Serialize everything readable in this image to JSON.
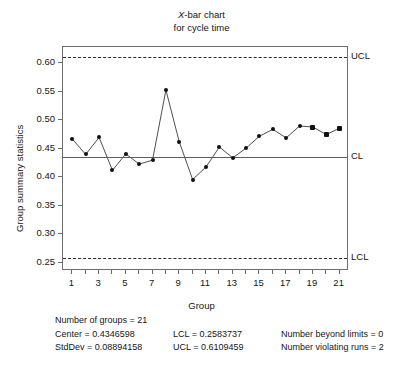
{
  "chart_data": {
    "type": "line",
    "title": "X-bar chart for cycle time",
    "title_lines": [
      "X-bar chart",
      "for cycle time"
    ],
    "title_italic_prefix": "X",
    "xlabel": "Group",
    "ylabel": "Group summary statistics",
    "x": [
      1,
      2,
      3,
      4,
      5,
      6,
      7,
      8,
      9,
      10,
      11,
      12,
      13,
      14,
      15,
      16,
      17,
      18,
      19,
      20,
      21
    ],
    "values": [
      0.467,
      0.44,
      0.47,
      0.412,
      0.441,
      0.423,
      0.43,
      0.553,
      0.462,
      0.396,
      0.418,
      0.453,
      0.434,
      0.451,
      0.472,
      0.484,
      0.469,
      0.49,
      0.488,
      0.475,
      0.486
    ],
    "marker_shapes": [
      "circle",
      "circle",
      "circle",
      "circle",
      "circle",
      "circle",
      "circle",
      "circle",
      "circle",
      "circle",
      "circle",
      "circle",
      "circle",
      "circle",
      "circle",
      "circle",
      "circle",
      "circle",
      "square",
      "square",
      "square"
    ],
    "ylim": [
      0.2355,
      0.6285
    ],
    "xlim": [
      0.3,
      21.7
    ],
    "ytick_values": [
      0.25,
      0.3,
      0.35,
      0.4,
      0.45,
      0.5,
      0.55,
      0.6
    ],
    "ytick_labels": [
      "0.25",
      "0.30",
      "0.35",
      "0.40",
      "0.45",
      "0.50",
      "0.55",
      "0.60"
    ],
    "xtick_values": [
      1,
      2,
      3,
      4,
      5,
      6,
      7,
      8,
      9,
      10,
      11,
      12,
      13,
      14,
      15,
      16,
      17,
      18,
      19,
      20,
      21
    ],
    "xtick_labels": [
      "1",
      "",
      "3",
      "",
      "5",
      "",
      "7",
      "",
      "9",
      "",
      "11",
      "",
      "13",
      "",
      "15",
      "",
      "17",
      "",
      "19",
      "",
      "21"
    ],
    "grid": false,
    "legend": "none",
    "reference_lines": [
      {
        "name": "UCL",
        "label": "UCL",
        "value": 0.6109459,
        "style": "dashed"
      },
      {
        "name": "CL",
        "label": "CL",
        "value": 0.4346598,
        "style": "solid"
      },
      {
        "name": "LCL",
        "label": "LCL",
        "value": 0.2583737,
        "style": "dashed"
      }
    ],
    "colors": {
      "point": "#101010",
      "line": "#3a3a3a",
      "center_line": "#5d5d5d",
      "limit_line": "#2a2a2a",
      "frame": "#6d6d6d",
      "background": "#ffffff"
    }
  },
  "footer": {
    "rows": [
      {
        "c1": "Number of groups = 21",
        "c2": "",
        "c3": ""
      },
      {
        "c1": "Center = 0.4346598",
        "c2": "LCL = 0.2583737",
        "c3": "Number beyond limits = 0"
      },
      {
        "c1": "StdDev = 0.08894158",
        "c2": "UCL = 0.6109459",
        "c3": "Number violating runs = 2"
      }
    ]
  }
}
